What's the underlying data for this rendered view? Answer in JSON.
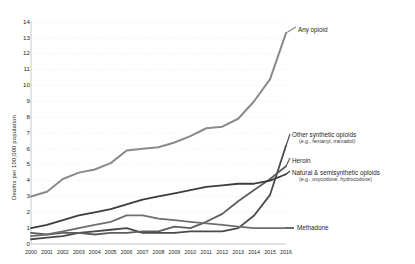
{
  "chart_data": {
    "type": "line",
    "title": "",
    "xlabel": "",
    "ylabel": "Deaths per 100,000 population",
    "ylim": [
      0,
      14
    ],
    "ytick_step": 1,
    "grid": true,
    "legend_position": "right-inline",
    "x": [
      2000,
      2001,
      2002,
      2003,
      2004,
      2005,
      2006,
      2007,
      2008,
      2009,
      2010,
      2011,
      2012,
      2013,
      2014,
      2015,
      2016
    ],
    "categories": [
      "2000",
      "2001",
      "2002",
      "2003",
      "2004",
      "2005",
      "2006",
      "2007",
      "2008",
      "2009",
      "2010",
      "2011",
      "2012",
      "2013",
      "2014",
      "2015",
      "2016"
    ],
    "yticks": [
      "0",
      "1",
      "2",
      "3",
      "4",
      "5",
      "6",
      "7",
      "8",
      "9",
      "10",
      "11",
      "12",
      "13",
      "14"
    ],
    "series": [
      {
        "name": "Any opioid",
        "label": "Any opioid",
        "sublabel": "",
        "color": "#8a8a8a",
        "width": 2.0,
        "values": [
          3.0,
          3.3,
          4.1,
          4.5,
          4.7,
          5.1,
          5.9,
          6.0,
          6.1,
          6.4,
          6.8,
          7.3,
          7.4,
          7.9,
          9.0,
          10.4,
          13.3
        ]
      },
      {
        "name": "Other synthetic opioids",
        "label": "Other synthetic opioids",
        "sublabel": "(e.g., fentanyl, tramadol)",
        "color": "#4a4a4a",
        "width": 1.8,
        "values": [
          0.3,
          0.4,
          0.5,
          0.7,
          0.8,
          0.9,
          1.0,
          0.7,
          0.7,
          0.7,
          0.8,
          0.8,
          0.8,
          1.0,
          1.8,
          3.1,
          6.2
        ]
      },
      {
        "name": "Heroin",
        "label": "Heroin",
        "sublabel": "",
        "color": "#5d5d5d",
        "width": 1.8,
        "values": [
          0.7,
          0.6,
          0.7,
          0.7,
          0.6,
          0.7,
          0.7,
          0.8,
          0.8,
          1.1,
          1.0,
          1.4,
          1.9,
          2.7,
          3.4,
          4.1,
          4.9
        ]
      },
      {
        "name": "Natural & semisynthetic opioids",
        "label": "Natural & semisynthetic opioids",
        "sublabel": "(e.g., oxycodone, hydrocodone)",
        "color": "#3d3d3d",
        "width": 1.8,
        "values": [
          1.0,
          1.2,
          1.5,
          1.8,
          2.0,
          2.2,
          2.5,
          2.8,
          3.0,
          3.2,
          3.4,
          3.6,
          3.7,
          3.8,
          3.8,
          4.0,
          4.4
        ]
      },
      {
        "name": "Methadone",
        "label": "Methadone",
        "sublabel": "",
        "color": "#6e6e6e",
        "width": 1.8,
        "values": [
          0.5,
          0.6,
          0.8,
          1.0,
          1.2,
          1.4,
          1.8,
          1.8,
          1.6,
          1.5,
          1.4,
          1.3,
          1.2,
          1.1,
          1.0,
          1.0,
          1.0
        ]
      }
    ],
    "annotations": [
      {
        "name": "any-opioid",
        "text": "Any opioid",
        "x": 298,
        "y": 26
      },
      {
        "name": "other-synthetic",
        "text": "Other synthetic opioids",
        "x": 292,
        "y": 131
      },
      {
        "name": "heroin",
        "text": "Heroin",
        "x": 292,
        "y": 157
      },
      {
        "name": "natural-semisynthetic",
        "text": "Natural & semisynthetic opioids",
        "x": 292,
        "y": 169
      },
      {
        "name": "methadone",
        "text": "Methadone",
        "x": 297,
        "y": 224
      }
    ]
  }
}
